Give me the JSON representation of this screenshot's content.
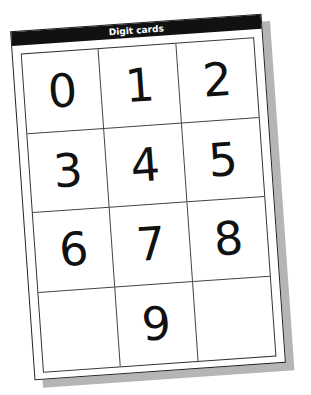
{
  "title": "Digit cards",
  "cards": [
    "0",
    "1",
    "2",
    "3",
    "4",
    "5",
    "6",
    "7",
    "8",
    "",
    "9",
    ""
  ]
}
